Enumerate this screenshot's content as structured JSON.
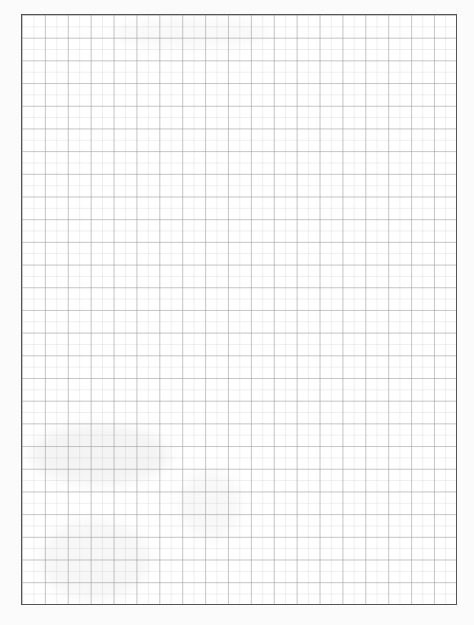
{
  "document": {
    "type": "graph-paper-sheet",
    "border_color": "#555555",
    "grid": {
      "major_spacing_px": 22.9,
      "minor_spacing_px": 11.45,
      "major_columns": 19,
      "major_rows": 26,
      "line_color": "#969696"
    }
  }
}
